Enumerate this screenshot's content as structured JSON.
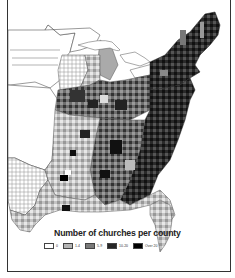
{
  "figure": {
    "title": "Number of churches per county",
    "region": "Eastern United States counties"
  },
  "legend": {
    "title": "Number of churches per county",
    "items": [
      {
        "label": "0",
        "color": "#ffffff"
      },
      {
        "label": "1-4",
        "color": "#b5b5b5"
      },
      {
        "label": "5-9",
        "color": "#7a7a7a"
      },
      {
        "label": "10-20",
        "color": "#262626"
      },
      {
        "label": "Over 20",
        "color": "#000000"
      }
    ]
  },
  "colors": {
    "border": "#333333",
    "state_line": "#555555",
    "background": "#ffffff"
  }
}
